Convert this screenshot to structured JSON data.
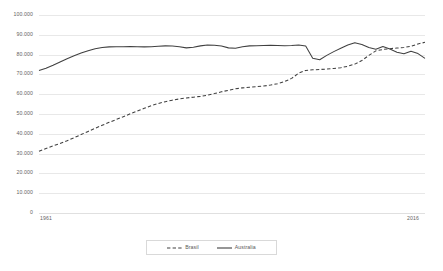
{
  "chart_data": {
    "type": "line",
    "title": "",
    "subtitle": "",
    "xlabel": "",
    "ylabel": "",
    "xlim": [
      1961,
      2016
    ],
    "ylim": [
      0,
      100000
    ],
    "y_ticks": [
      0,
      10000,
      20000,
      30000,
      40000,
      50000,
      60000,
      70000,
      80000,
      90000,
      100000
    ],
    "y_tick_labels": [
      "0",
      "10.000",
      "20.000",
      "30.000",
      "40.000",
      "50.000",
      "60.000",
      "70.000",
      "80.000",
      "90.000",
      "100.000"
    ],
    "x_tick_labels": [
      "1961",
      "2016"
    ],
    "x_tick_values": [
      1961,
      2016
    ],
    "grid": "horizontal",
    "legend_position": "bottom-center",
    "x": [
      1961,
      1962,
      1963,
      1964,
      1965,
      1966,
      1967,
      1968,
      1969,
      1970,
      1971,
      1972,
      1973,
      1974,
      1975,
      1976,
      1977,
      1978,
      1979,
      1980,
      1981,
      1982,
      1983,
      1984,
      1985,
      1986,
      1987,
      1988,
      1989,
      1990,
      1991,
      1992,
      1993,
      1994,
      1995,
      1996,
      1997,
      1998,
      1999,
      2000,
      2001,
      2002,
      2003,
      2004,
      2005,
      2006,
      2007,
      2008,
      2009,
      2010,
      2011,
      2012,
      2013,
      2014,
      2015,
      2016
    ],
    "series": [
      {
        "name": "Brasil",
        "style": "dashed",
        "color": "#404040",
        "values": [
          31200,
          32600,
          33900,
          35100,
          36500,
          38000,
          39600,
          41200,
          42800,
          44300,
          45800,
          47200,
          48600,
          50100,
          51500,
          52900,
          54200,
          55300,
          56200,
          57000,
          57600,
          58100,
          58500,
          58900,
          59500,
          60300,
          61200,
          62000,
          62700,
          63200,
          63500,
          63800,
          64100,
          64600,
          65300,
          66400,
          68000,
          70600,
          72000,
          72300,
          72500,
          72700,
          73000,
          73400,
          74100,
          75200,
          77000,
          79600,
          81900,
          82600,
          83000,
          83300,
          83600,
          84200,
          85400,
          86200
        ]
      },
      {
        "name": "Australia",
        "style": "solid",
        "color": "#404040",
        "values": [
          72000,
          73100,
          74600,
          76300,
          77900,
          79400,
          80800,
          82000,
          83000,
          83600,
          83900,
          84000,
          84000,
          84100,
          84000,
          83900,
          84000,
          84200,
          84400,
          84300,
          84000,
          83400,
          83700,
          84400,
          84800,
          84700,
          84300,
          83400,
          83200,
          84000,
          84400,
          84500,
          84600,
          84700,
          84600,
          84500,
          84600,
          84800,
          84300,
          78200,
          77400,
          79600,
          81500,
          83200,
          84800,
          86000,
          85100,
          83600,
          82700,
          84100,
          82800,
          81200,
          80400,
          81700,
          80500,
          78100
        ]
      }
    ],
    "crossover_note": "Brasil surpasses Australia near the right end of the range"
  },
  "legend": {
    "items": [
      {
        "label": "Brasil",
        "style": "dashed"
      },
      {
        "label": "Australia",
        "style": "solid"
      }
    ]
  },
  "colors": {
    "series_line": "#404040",
    "gridline": "#e8e8e8",
    "axis_text": "#646464",
    "legend_border": "#d9d9d9",
    "background": "#ffffff"
  }
}
